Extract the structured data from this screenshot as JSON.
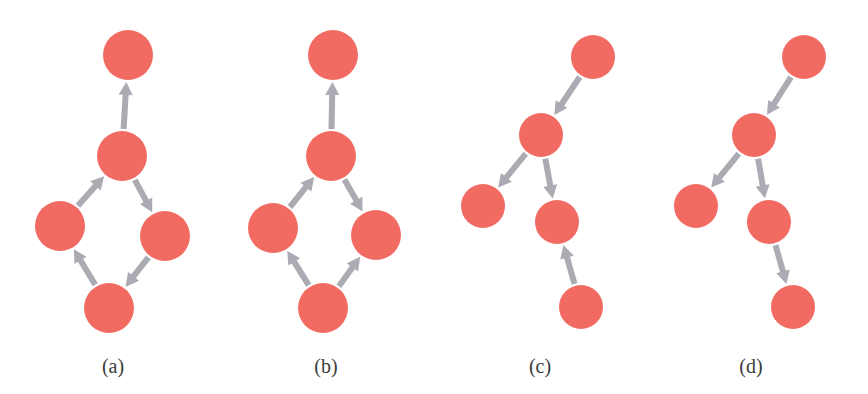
{
  "figure": {
    "width": 868,
    "height": 394,
    "colors": {
      "node": "#F26B63",
      "edge": "#ABABB3",
      "label": "#3a3a3a",
      "background": "#ffffff"
    },
    "edge_width": 6,
    "arrowhead_length": 13,
    "arrowhead_half_width": 7
  },
  "panels": [
    {
      "id": "a",
      "label": "(a)",
      "label_pos": [
        113,
        373
      ],
      "node_radius": 25,
      "nodes": [
        {
          "id": "top",
          "x": 128,
          "y": 55
        },
        {
          "id": "mid",
          "x": 122,
          "y": 156
        },
        {
          "id": "left",
          "x": 60,
          "y": 226
        },
        {
          "id": "right",
          "x": 165,
          "y": 236
        },
        {
          "id": "bottom",
          "x": 109,
          "y": 308
        }
      ],
      "edges": [
        {
          "from": "mid",
          "to": "top"
        },
        {
          "from": "left",
          "to": "mid"
        },
        {
          "from": "mid",
          "to": "right"
        },
        {
          "from": "right",
          "to": "bottom"
        },
        {
          "from": "bottom",
          "to": "left"
        }
      ]
    },
    {
      "id": "b",
      "label": "(b)",
      "label_pos": [
        326,
        373
      ],
      "node_radius": 25,
      "nodes": [
        {
          "id": "top",
          "x": 333,
          "y": 55
        },
        {
          "id": "mid",
          "x": 331,
          "y": 156
        },
        {
          "id": "left",
          "x": 273,
          "y": 228
        },
        {
          "id": "right",
          "x": 376,
          "y": 235
        },
        {
          "id": "bottom",
          "x": 323,
          "y": 308
        }
      ],
      "edges": [
        {
          "from": "mid",
          "to": "top"
        },
        {
          "from": "left",
          "to": "mid"
        },
        {
          "from": "mid",
          "to": "right"
        },
        {
          "from": "bottom",
          "to": "left"
        },
        {
          "from": "bottom",
          "to": "right"
        }
      ]
    },
    {
      "id": "c",
      "label": "(c)",
      "label_pos": [
        540,
        373
      ],
      "node_radius": 22,
      "nodes": [
        {
          "id": "top",
          "x": 593,
          "y": 57
        },
        {
          "id": "mid",
          "x": 541,
          "y": 135
        },
        {
          "id": "left",
          "x": 483,
          "y": 206
        },
        {
          "id": "right",
          "x": 557,
          "y": 222
        },
        {
          "id": "bottom",
          "x": 581,
          "y": 307
        }
      ],
      "edges": [
        {
          "from": "top",
          "to": "mid"
        },
        {
          "from": "mid",
          "to": "left"
        },
        {
          "from": "mid",
          "to": "right"
        },
        {
          "from": "bottom",
          "to": "right"
        }
      ]
    },
    {
      "id": "d",
      "label": "(d)",
      "label_pos": [
        751,
        373
      ],
      "node_radius": 22,
      "nodes": [
        {
          "id": "top",
          "x": 804,
          "y": 57
        },
        {
          "id": "mid",
          "x": 754,
          "y": 135
        },
        {
          "id": "left",
          "x": 696,
          "y": 206
        },
        {
          "id": "right",
          "x": 769,
          "y": 222
        },
        {
          "id": "bottom",
          "x": 793,
          "y": 307
        }
      ],
      "edges": [
        {
          "from": "top",
          "to": "mid"
        },
        {
          "from": "mid",
          "to": "left"
        },
        {
          "from": "mid",
          "to": "right"
        },
        {
          "from": "right",
          "to": "bottom"
        }
      ]
    }
  ]
}
